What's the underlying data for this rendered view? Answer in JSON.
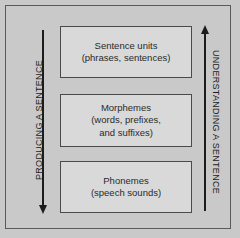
{
  "diagram": {
    "background_color": "#c9c9c9",
    "frame_color": "#5a5a5a",
    "box_fill_color": "#d9d9d9",
    "box_border_color": "#4a4a4a",
    "arrow_color": "#1c1c1c",
    "boxes": [
      {
        "name": "sentence-units",
        "line1": "Sentence units",
        "line2": "(phrases, sentences)"
      },
      {
        "name": "morphemes",
        "line1": "Morphemes",
        "line2": "(words, prefixes,",
        "line3": "and suffixes)"
      },
      {
        "name": "phonemes",
        "line1": "Phonemes",
        "line2": "(speech sounds)"
      }
    ],
    "left_axis": {
      "label": "PRODUCING A SENTENCE",
      "arrow_direction": "down",
      "arrow_icon": "arrow-down-icon"
    },
    "right_axis": {
      "label": "UNDERSTANDING A SENTENCE",
      "arrow_direction": "up",
      "arrow_icon": "arrow-up-icon"
    }
  }
}
